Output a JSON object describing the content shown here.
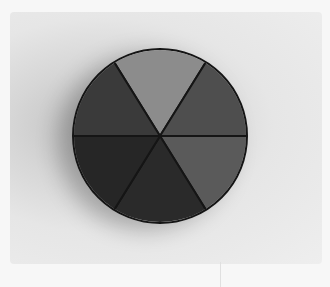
{
  "image": {
    "description": "Photograph of a circular disc divided into six grey-shaded wedge segments on a light background",
    "background_color": "#eaeaea",
    "disc": {
      "segments": 6,
      "colors": [
        "#8c8c8c",
        "#4e4e4e",
        "#5a5a5a",
        "#2a2a2a",
        "#262626",
        "#3a3a3a"
      ],
      "outline_color": "#151515"
    }
  }
}
